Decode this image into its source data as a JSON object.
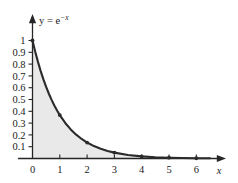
{
  "chart_data": {
    "type": "line",
    "title": "",
    "subtitle": "",
    "curve_label": "y = e",
    "curve_label_exponent": "−x",
    "function": "y = e^(-x)",
    "xlabel": "x",
    "ylabel": "",
    "xlim": [
      0,
      6.9
    ],
    "ylim": [
      0,
      1.05
    ],
    "grid": false,
    "legend": null,
    "shaded_area": {
      "present": true,
      "color": "#e9e9e9",
      "from_x": 0,
      "to_x": 6,
      "description": "region between curve and x-axis"
    },
    "x_ticks": [
      0,
      1,
      2,
      3,
      4,
      5,
      6
    ],
    "x_tick_labels": [
      "0",
      "1",
      "2",
      "3",
      "4",
      "5",
      "6"
    ],
    "y_ticks": [
      0.1,
      0.2,
      0.3,
      0.4,
      0.5,
      0.6,
      0.7,
      0.8,
      0.9,
      1.0
    ],
    "y_tick_labels": [
      "0.1",
      "0.2",
      "0.3",
      "0.4",
      "0.5",
      "0.6",
      "0.7",
      "0.8",
      "0.9",
      "1"
    ],
    "marker_points": {
      "x": [
        0,
        1,
        2,
        3,
        4,
        5,
        6
      ],
      "y": [
        1.0,
        0.368,
        0.135,
        0.05,
        0.018,
        0.007,
        0.002
      ]
    },
    "series": [
      {
        "name": "y = e^(-x)",
        "color": "#2b2b2b",
        "x": [
          0,
          0.1,
          0.2,
          0.3,
          0.4,
          0.5,
          0.6,
          0.7,
          0.8,
          0.9,
          1.0,
          1.2,
          1.4,
          1.6,
          1.8,
          2.0,
          2.25,
          2.5,
          2.75,
          3.0,
          3.5,
          4.0,
          4.5,
          5.0,
          5.5,
          6.0,
          6.5
        ],
        "y": [
          1.0,
          0.9048,
          0.8187,
          0.7408,
          0.6703,
          0.6065,
          0.5488,
          0.4966,
          0.4493,
          0.4066,
          0.3679,
          0.3012,
          0.2466,
          0.2019,
          0.1653,
          0.1353,
          0.1054,
          0.0821,
          0.0639,
          0.0498,
          0.0302,
          0.0183,
          0.0111,
          0.0067,
          0.0041,
          0.0025,
          0.0015
        ]
      }
    ],
    "colors": {
      "curve": "#2b2b2b",
      "axis": "#262626",
      "fill": "#e9e9e9",
      "text": "#1a1a1a",
      "background": "#ffffff"
    }
  }
}
